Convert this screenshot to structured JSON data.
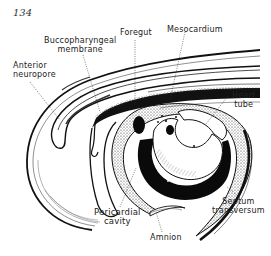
{
  "page_number": "134",
  "figure": {
    "labels": {
      "foregut": "Foregut",
      "mesocardium": "Mesocardium",
      "buccopharyngeal_line1": "Buccopharyngeal",
      "buccopharyngeal_line2": "membrane",
      "anterior_neuropore_line1": "Anterior",
      "anterior_neuropore_line2": "neuropore",
      "heart_tube_line1": "Heart",
      "heart_tube_line2": "tube",
      "pericardial_cavity_line1": "Pericardial",
      "pericardial_cavity_line2": "cavity",
      "septum_transversum_line1": "Septum",
      "septum_transversum_line2": "transversum",
      "amnion": "Amnion"
    }
  }
}
